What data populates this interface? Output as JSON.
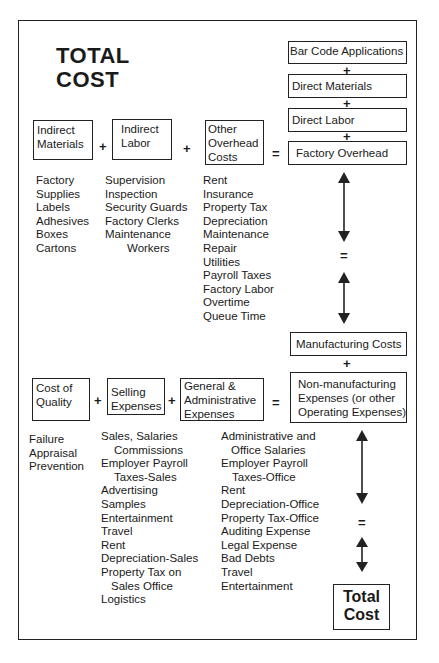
{
  "title": {
    "line1": "TOTAL",
    "line2": "COST"
  },
  "top_stack": {
    "boxes": [
      "Bar Code Applications",
      "Direct Materials",
      "Direct Labor",
      "Factory Overhead"
    ],
    "operators": [
      "+",
      "+",
      "+"
    ]
  },
  "overhead_row": {
    "boxes": [
      {
        "line1": "Indirect",
        "line2": "Materials",
        "line3": ""
      },
      {
        "line1": "Indirect",
        "line2": "Labor",
        "line3": ""
      },
      {
        "line1": "Other",
        "line2": "Overhead",
        "line3": "Costs"
      }
    ],
    "operators": [
      "+",
      "+",
      "="
    ],
    "lists": {
      "indirect_materials": [
        "Factory",
        "Supplies",
        "Labels",
        "Adhesives",
        "Boxes",
        "Cartons"
      ],
      "indirect_labor": [
        "Supervision",
        "Inspection",
        "Security Guards",
        "Factory Clerks",
        "Maintenance",
        "Workers"
      ],
      "other_overhead": [
        "Rent",
        "Insurance",
        "Property Tax",
        "Depreciation",
        "Maintenance",
        "Repair",
        "Utilities",
        "Payroll Taxes",
        "Factory Labor",
        "Overtime",
        "Queue Time"
      ]
    }
  },
  "middle": {
    "equals": "=",
    "manufacturing_costs": "Manufacturing Costs",
    "plus": "+"
  },
  "nonmfg_row": {
    "boxes": [
      {
        "line1": "Cost of",
        "line2": "Quality",
        "line3": ""
      },
      {
        "line1": "Selling",
        "line2": "Expenses",
        "line3": ""
      },
      {
        "line1": "General &",
        "line2": "Administrative",
        "line3": "Expenses"
      },
      {
        "line1": "Non-manufacturing",
        "line2": "Expenses (or other",
        "line3": "Operating Expenses)"
      }
    ],
    "operators": [
      "+",
      "+",
      "="
    ],
    "lists": {
      "cost_of_quality": [
        "Failure",
        "Appraisal",
        "Prevention"
      ],
      "selling": [
        "Sales, Salaries",
        "Commissions",
        "Employer Payroll",
        "Taxes-Sales",
        "Advertising",
        "Samples",
        "Entertainment",
        "Travel",
        "Rent",
        "Depreciation-Sales",
        "Property Tax on",
        "Sales Office",
        "Logistics"
      ],
      "general_admin": [
        "Administrative and",
        "Office Salaries",
        "Employer Payroll",
        "Taxes-Office",
        "Rent",
        "Depreciation-Office",
        "Property Tax-Office",
        "Auditing Expense",
        "Legal Expense",
        "Bad Debts",
        "Travel",
        "Entertainment"
      ]
    }
  },
  "bottom": {
    "equals": "=",
    "total_line1": "Total",
    "total_line2": "Cost"
  }
}
